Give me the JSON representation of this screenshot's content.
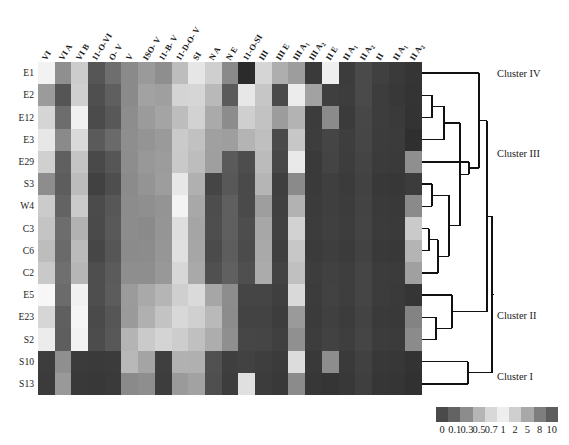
{
  "figure": {
    "type": "heatmap-dendrogram",
    "background": "#ffffff",
    "row_labels": [
      "E1",
      "E2",
      "E12",
      "E3",
      "E29",
      "S3",
      "W4",
      "C3",
      "C6",
      "C2",
      "E5",
      "E23",
      "S2",
      "S10",
      "S13"
    ],
    "column_labels": [
      "VI",
      "VI A",
      "VI B",
      "11-O-VI",
      "O- V",
      "V",
      "ISO- V",
      "11-B- V",
      "11-D-O- V",
      "SI",
      "N A",
      "N E",
      "11-O-SI",
      "III",
      "III E",
      "III A",
      "III A",
      "II E",
      "II A",
      "II A",
      "II",
      "II A",
      "II A"
    ],
    "column_labels_sub": [
      "",
      "",
      "",
      "",
      "",
      "",
      "",
      "",
      "",
      "",
      "",
      "",
      "",
      "",
      "",
      "1",
      "2",
      "",
      "1",
      "2",
      "",
      "1",
      "2"
    ],
    "cluster_labels": [
      "Cluster IV",
      "Cluster III",
      "Cluster II",
      "Cluster I"
    ]
  },
  "colorbar": {
    "tick_labels": [
      "0",
      "0.1",
      "0.3",
      "0.5",
      "0.7",
      "1",
      "2",
      "5",
      "8",
      "10"
    ],
    "swatch_colors": [
      "#4a4a4a",
      "#636363",
      "#8c8c8c",
      "#b5b5b5",
      "#d8d8d8",
      "#eeeeee",
      "#cfcfcf",
      "#a8a8a8",
      "#7e7e7e",
      "#5e5e5e"
    ],
    "orientation": "horizontal"
  },
  "chart_data": {
    "type": "heatmap",
    "title": "",
    "xlabel": "",
    "ylabel": "",
    "categories": [
      "VI",
      "VI A",
      "VI B",
      "11-O-VI",
      "O- V",
      "V",
      "ISO- V",
      "11-B- V",
      "11-D-O- V",
      "SI",
      "N A",
      "N E",
      "11-O-SI",
      "III",
      "III E",
      "III A1",
      "III A2",
      "II E",
      "II A1",
      "II A2",
      "II",
      "II A1",
      "II A2"
    ],
    "rows": [
      "E1",
      "E2",
      "E12",
      "E3",
      "E29",
      "S3",
      "W4",
      "C3",
      "C6",
      "C2",
      "E5",
      "E23",
      "S2",
      "S10",
      "S13"
    ],
    "scale_ticks": [
      "0",
      "0.1",
      "0.3",
      "0.5",
      "0.7",
      "1",
      "2",
      "5",
      "8",
      "10"
    ],
    "grid": false,
    "legend_position": "bottom-right",
    "cell_colors": [
      [
        "#f2f2f2",
        "#8f8f8f",
        "#cccccc",
        "#565656",
        "#6e6e6e",
        "#8a8a8a",
        "#9a9a9a",
        "#8e8e8e",
        "#bdbdbd",
        "#e6e6e6",
        "#cfcfcf",
        "#8a8a8a",
        "#2b2b2b",
        "#d5d5d5",
        "#aeaeae",
        "#9d9d9d",
        "#3a3a3a",
        "#efefef",
        "#3c3c3c",
        "#4a4a4a",
        "#404040",
        "#3a3a3a",
        "#353535"
      ],
      [
        "#9b9b9b",
        "#555555",
        "#cfcfcf",
        "#4f4f4f",
        "#5f5f5f",
        "#8a8a8a",
        "#a2a2a2",
        "#9f9f9f",
        "#d4d4d4",
        "#d6d6d6",
        "#b9b9b9",
        "#5b5b5b",
        "#e7e7e7",
        "#c6c6c6",
        "#4a4a4a",
        "#ececec",
        "#a2a2a2",
        "#3f3f3f",
        "#3d3d3d",
        "#4a4a4a",
        "#3d3d3d",
        "#383838",
        "#343434"
      ],
      [
        "#d5d5d5",
        "#6d6d6d",
        "#f0f0f0",
        "#4b4b4b",
        "#585858",
        "#8d8d8d",
        "#9b9b9b",
        "#a4a4a4",
        "#bdbdbd",
        "#d2d2d2",
        "#aaaaaa",
        "#8c8c8c",
        "#cfcfcf",
        "#c2c2c2",
        "#9c9c9c",
        "#b3b3b3",
        "#3c3c3c",
        "#8b8b8b",
        "#3b3b3b",
        "#474747",
        "#3d3d3d",
        "#3a3a3a",
        "#333333"
      ],
      [
        "#e7e7e7",
        "#8a8a8a",
        "#d9d9d9",
        "#5a5a5a",
        "#6a6a6a",
        "#8e8e8e",
        "#949494",
        "#9a9a9a",
        "#cacaca",
        "#c1c1c1",
        "#a0a0a0",
        "#9e9e9e",
        "#b4b4b4",
        "#bfbfbf",
        "#4a4a4a",
        "#c7c7c7",
        "#3d3d3d",
        "#454545",
        "#3e3e3e",
        "#464646",
        "#3c3c3c",
        "#3b3b3b",
        "#2f2f2f"
      ],
      [
        "#d0d0d0",
        "#606060",
        "#c4c4c4",
        "#494949",
        "#565656",
        "#8d8d8d",
        "#989898",
        "#9c9c9c",
        "#c9c9c9",
        "#bdbdbd",
        "#9f9f9f",
        "#5a5a5a",
        "#4d4d4d",
        "#bbbbbb",
        "#474747",
        "#e9e9e9",
        "#3a3a3a",
        "#444444",
        "#3d3d3d",
        "#444444",
        "#3b3b3b",
        "#3a3a3a",
        "#8f8f8f"
      ],
      [
        "#8d8d8d",
        "#5d5d5d",
        "#bcbcbc",
        "#414141",
        "#4e4e4e",
        "#8b8b8b",
        "#949494",
        "#9d9d9d",
        "#e7e7e7",
        "#b0b0b0",
        "#454545",
        "#585858",
        "#4a4a4a",
        "#b5b5b5",
        "#3f3f3f",
        "#8a8a8a",
        "#3a3a3a",
        "#3f3f3f",
        "#3b3b3b",
        "#424242",
        "#383838",
        "#373737",
        "#3c3c3c"
      ],
      [
        "#cbcbcb",
        "#636363",
        "#cbcbcb",
        "#4b4b4b",
        "#575757",
        "#8c8c8c",
        "#8f8f8f",
        "#949494",
        "#f3f3f3",
        "#a8a8a8",
        "#4d4d4d",
        "#5f5f5f",
        "#4a4a4a",
        "#9e9e9e",
        "#404040",
        "#b2b2b2",
        "#3b3b3b",
        "#3f3f3f",
        "#3c3c3c",
        "#434343",
        "#3a3a3a",
        "#393939",
        "#8a8a8a"
      ],
      [
        "#c4c4c4",
        "#6d6d6d",
        "#b2b2b2",
        "#4a4a4a",
        "#595959",
        "#8c8c8c",
        "#8a8a8a",
        "#959595",
        "#dedede",
        "#a5a5a5",
        "#4e4e4e",
        "#5f5f5f",
        "#4d4d4d",
        "#a7a7a7",
        "#414141",
        "#d2d2d2",
        "#3c3c3c",
        "#404040",
        "#3d3d3d",
        "#444444",
        "#3b3b3b",
        "#3a3a3a",
        "#cacaca"
      ],
      [
        "#bdbdbd",
        "#6a6a6a",
        "#bbbbbb",
        "#464646",
        "#565656",
        "#8b8b8b",
        "#8c8c8c",
        "#969696",
        "#e0e0e0",
        "#a6a6a6",
        "#4b4b4b",
        "#5d5d5d",
        "#4b4b4b",
        "#a9a9a9",
        "#3f3f3f",
        "#c7c7c7",
        "#3b3b3b",
        "#3e3e3e",
        "#3b3b3b",
        "#424242",
        "#393939",
        "#383838",
        "#b4b4b4"
      ],
      [
        "#c9c9c9",
        "#6f6f6f",
        "#b6b6b6",
        "#4e4e4e",
        "#5b5b5b",
        "#8e8e8e",
        "#8e8e8e",
        "#989898",
        "#d7d7d7",
        "#a9a9a9",
        "#505050",
        "#606060",
        "#4f4f4f",
        "#ababab",
        "#434343",
        "#c0c0c0",
        "#3d3d3d",
        "#414141",
        "#3e3e3e",
        "#454545",
        "#3c3c3c",
        "#3b3b3b",
        "#a0a0a0"
      ],
      [
        "#f7f7f7",
        "#6b6b6b",
        "#f1f1f1",
        "#4e4e4e",
        "#5c5c5c",
        "#9b9b9b",
        "#a9a9a9",
        "#b5b5b5",
        "#cfcfcf",
        "#dadada",
        "#a6a6a6",
        "#8d8d8d",
        "#454545",
        "#454545",
        "#3f3f3f",
        "#d9d9d9",
        "#3c3c3c",
        "#424242",
        "#3e3e3e",
        "#454545",
        "#3c3c3c",
        "#3a3a3a",
        "#353535"
      ],
      [
        "#d6d6d6",
        "#5f5f5f",
        "#f5f5f5",
        "#4a4a4a",
        "#565656",
        "#9a9a9a",
        "#b0b0b0",
        "#c3c3c3",
        "#d8d8d8",
        "#d0d0d0",
        "#b9b9b9",
        "#8c8c8c",
        "#434343",
        "#434343",
        "#3d3d3d",
        "#9a9a9a",
        "#3b3b3b",
        "#404040",
        "#3c3c3c",
        "#434343",
        "#3a3a3a",
        "#393939",
        "#838383"
      ],
      [
        "#ececec",
        "#5e5e5e",
        "#f2f2f2",
        "#4c4c4c",
        "#585858",
        "#b4b4b4",
        "#cacaca",
        "#d4d4d4",
        "#cdcdcd",
        "#c0c0c0",
        "#adadad",
        "#8f8f8f",
        "#464646",
        "#454545",
        "#404040",
        "#909090",
        "#3d3d3d",
        "#424242",
        "#3e3e3e",
        "#454545",
        "#3c3c3c",
        "#3b3b3b",
        "#8b8b8b"
      ],
      [
        "#3d3d3d",
        "#8f8f8f",
        "#3b3b3b",
        "#3a3a3a",
        "#3b3b3b",
        "#b8b8b8",
        "#a4a4a4",
        "#3f3f3f",
        "#b1b1b1",
        "#b0b0b0",
        "#515151",
        "#3f3f3f",
        "#424242",
        "#3e3e3e",
        "#3b3b3b",
        "#dcdcdc",
        "#393939",
        "#8d8d8d",
        "#3a3a3a",
        "#414141",
        "#383838",
        "#373737",
        "#333333"
      ],
      [
        "#3b3b3b",
        "#999999",
        "#393939",
        "#383838",
        "#3a3a3a",
        "#8a8a8a",
        "#8e8e8e",
        "#3d3d3d",
        "#9a9a9a",
        "#a2a2a2",
        "#4f4f4f",
        "#3d3d3d",
        "#e0e0e0",
        "#3c3c3c",
        "#393939",
        "#8b8b8b",
        "#373737",
        "#353535",
        "#383838",
        "#3f3f3f",
        "#363636",
        "#353535",
        "#313131"
      ]
    ]
  },
  "dendrogram": {
    "line_color": "#111111",
    "line_width": 1.3,
    "leaf_order": [
      "E1",
      "E2",
      "E12",
      "E3",
      "E29",
      "S3",
      "W4",
      "C3",
      "C6",
      "C2",
      "E5",
      "E23",
      "S2",
      "S10",
      "S13"
    ]
  }
}
